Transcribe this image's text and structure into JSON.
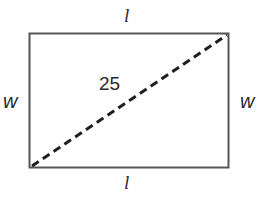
{
  "diagram": {
    "type": "rectangle-with-diagonal",
    "colors": {
      "stroke": "#555555",
      "diagonal": "#1e1e1e",
      "text": "#2a2a2a",
      "background": "#ffffff"
    },
    "labels": {
      "top_side": "l",
      "bottom_side": "l",
      "left_side": "w",
      "right_side": "w",
      "diagonal": "25"
    },
    "diagonal_style": "dashed"
  }
}
